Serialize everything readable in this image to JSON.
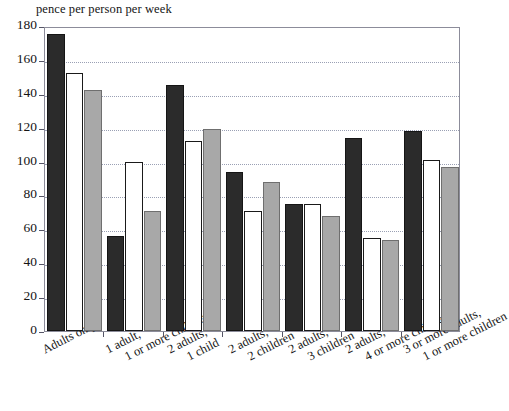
{
  "chart_data": {
    "type": "bar",
    "title": "pence per person per week",
    "xlabel": "",
    "ylabel": "",
    "ylim": [
      0,
      180
    ],
    "yticks": [
      0,
      20,
      40,
      60,
      80,
      100,
      120,
      140,
      160,
      180
    ],
    "grid": true,
    "legend": "none",
    "categories": [
      "Adults only",
      "1 adult, 1 or more children",
      "2 adults, 1 child",
      "2 adults, 2 children",
      "2 adults, 3 children",
      "2 adults, 4 or more children",
      "3 or more adults, 1 or more children"
    ],
    "category_lines": [
      [
        "Adults only",
        ""
      ],
      [
        "1 adult,",
        "1 or more children"
      ],
      [
        "2 adults,",
        "1 child"
      ],
      [
        "2 adults,",
        "2 children"
      ],
      [
        "2 adults,",
        "3 children"
      ],
      [
        "2 adults,",
        "4 or more children"
      ],
      [
        "3 or more adults,",
        "1 or more children"
      ]
    ],
    "series": [
      {
        "name": "series-1",
        "color": "#2b2b2b",
        "style": "black",
        "values": [
          175,
          56,
          145,
          94,
          75,
          114,
          118
        ]
      },
      {
        "name": "series-2",
        "color": "#ffffff",
        "style": "white",
        "values": [
          152,
          100,
          112,
          71,
          75,
          55,
          101
        ]
      },
      {
        "name": "series-3",
        "color": "#a8a8a8",
        "style": "gray",
        "values": [
          142,
          71,
          119,
          88,
          68,
          54,
          97
        ]
      }
    ]
  },
  "axis": {
    "tick_labels": [
      "180",
      "160",
      "140",
      "120",
      "100",
      "80",
      "60",
      "40",
      "20"
    ]
  }
}
